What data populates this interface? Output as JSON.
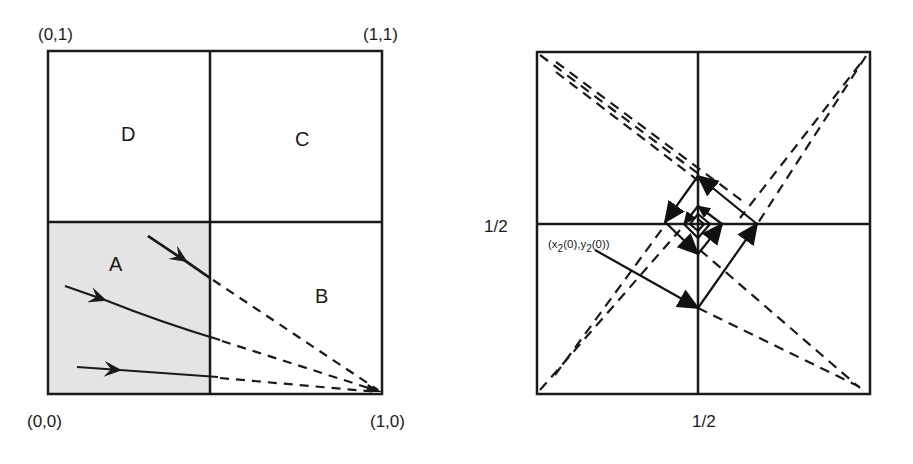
{
  "left_panel": {
    "corners": {
      "top_left": "(0,1)",
      "top_right": "(1,1)",
      "bottom_left": "(0,0)",
      "bottom_right": "(1,0)"
    },
    "regions": {
      "a": "A",
      "b": "B",
      "c": "C",
      "d": "D"
    },
    "shaded_region": "A",
    "colors": {
      "shade": "#e4e4e4",
      "line": "#1a1a1a"
    }
  },
  "right_panel": {
    "axis_labels": {
      "y_mid": "1/2",
      "x_mid": "1/2"
    },
    "initial_point": {
      "x_main": "(x",
      "x_sub": "2",
      "mid": "(0),y",
      "y_sub": "2",
      "end": "(0))"
    }
  }
}
